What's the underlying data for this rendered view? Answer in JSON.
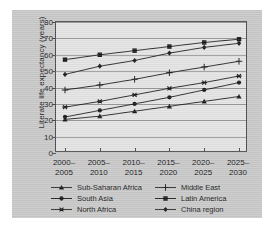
{
  "chart_data": {
    "type": "line",
    "title": "",
    "xlabel": "",
    "ylabel": "Literate life expectancy (years)",
    "categories": [
      "2000–2005",
      "2005–2010",
      "2010–2015",
      "2015–2020",
      "2020–2025",
      "2025–2030"
    ],
    "ylim": [
      0,
      80
    ],
    "yticks": [
      0,
      10,
      20,
      30,
      40,
      50,
      60,
      70,
      80
    ],
    "grid": true,
    "legend_position": "below-axes",
    "series": [
      {
        "name": "Sub-Saharan Africa",
        "marker": "triangle",
        "values": [
          20.5,
          22.5,
          25.5,
          28.5,
          31.5,
          34.5
        ]
      },
      {
        "name": "South Asia",
        "marker": "circle",
        "values": [
          22.0,
          26.0,
          30.0,
          34.0,
          38.5,
          43.0
        ]
      },
      {
        "name": "North Africa",
        "marker": "star",
        "values": [
          28.0,
          31.5,
          35.5,
          39.5,
          43.0,
          47.0
        ]
      },
      {
        "name": "Middle East",
        "marker": "plus",
        "values": [
          38.5,
          41.5,
          45.0,
          49.0,
          52.5,
          56.0
        ]
      },
      {
        "name": "Latin America",
        "marker": "square",
        "values": [
          57.0,
          60.0,
          62.5,
          65.0,
          67.5,
          69.5
        ]
      },
      {
        "name": "China region",
        "marker": "diamond",
        "values": [
          48.0,
          53.0,
          56.5,
          61.0,
          64.5,
          67.0
        ]
      }
    ]
  },
  "legend": {
    "items": [
      {
        "label": "Sub-Saharan Africa",
        "marker": "triangle"
      },
      {
        "label": "Middle East",
        "marker": "plus"
      },
      {
        "label": "South Asia",
        "marker": "circle"
      },
      {
        "label": "Latin America",
        "marker": "square"
      },
      {
        "label": "North Africa",
        "marker": "star"
      },
      {
        "label": "China region",
        "marker": "diamond"
      }
    ]
  },
  "colors": {
    "series": "#1a1a1a",
    "figure_background": "#c9c9c9",
    "plot_background": "#e4e4e4",
    "axis": "#4a4a4a",
    "grid": "#9a9a9a",
    "text": "#1b1b1b"
  }
}
